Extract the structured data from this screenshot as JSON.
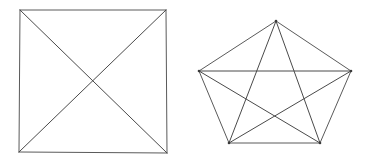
{
  "canvas": {
    "width": 371,
    "height": 159,
    "background_color": "#ffffff"
  },
  "style": {
    "line_color": "#5a5a5a",
    "line_color_dark": "#4a4a4a",
    "line_width": 1,
    "vertex_color": "#3a3a3a",
    "vertex_radius": 1.3
  },
  "figures": [
    {
      "id": "square-with-diagonals",
      "name": "Square with both diagonals",
      "shape": "square",
      "vertex_count": 4,
      "edge_count": 6,
      "vertices": [
        {
          "label": "A",
          "position": "top-left",
          "x": 20,
          "y": 10
        },
        {
          "label": "B",
          "position": "top-right",
          "x": 166,
          "y": 10
        },
        {
          "label": "C",
          "position": "bottom-right",
          "x": 167,
          "y": 153
        },
        {
          "label": "D",
          "position": "bottom-left",
          "x": 19,
          "y": 152
        }
      ],
      "edges": [
        {
          "from": 0,
          "to": 1,
          "kind": "side"
        },
        {
          "from": 1,
          "to": 2,
          "kind": "side"
        },
        {
          "from": 2,
          "to": 3,
          "kind": "side"
        },
        {
          "from": 3,
          "to": 0,
          "kind": "side"
        },
        {
          "from": 0,
          "to": 2,
          "kind": "diagonal"
        },
        {
          "from": 1,
          "to": 3,
          "kind": "diagonal"
        }
      ],
      "show_vertex_dots": false
    },
    {
      "id": "pentagon-with-diagonals",
      "name": "Regular pentagon with all diagonals forming a pentagram",
      "shape": "pentagon",
      "vertex_count": 5,
      "edge_count": 10,
      "vertices": [
        {
          "label": "P1",
          "position": "top",
          "x": 276,
          "y": 21
        },
        {
          "label": "P2",
          "position": "right",
          "x": 351,
          "y": 71
        },
        {
          "label": "P3",
          "position": "bottom-right",
          "x": 320,
          "y": 143
        },
        {
          "label": "P4",
          "position": "bottom-left",
          "x": 229,
          "y": 143
        },
        {
          "label": "P5",
          "position": "left",
          "x": 199,
          "y": 71
        }
      ],
      "edges": [
        {
          "from": 0,
          "to": 1,
          "kind": "side"
        },
        {
          "from": 1,
          "to": 2,
          "kind": "side"
        },
        {
          "from": 2,
          "to": 3,
          "kind": "side"
        },
        {
          "from": 3,
          "to": 4,
          "kind": "side"
        },
        {
          "from": 4,
          "to": 0,
          "kind": "side"
        },
        {
          "from": 0,
          "to": 2,
          "kind": "diagonal"
        },
        {
          "from": 0,
          "to": 3,
          "kind": "diagonal"
        },
        {
          "from": 1,
          "to": 3,
          "kind": "diagonal"
        },
        {
          "from": 1,
          "to": 4,
          "kind": "diagonal"
        },
        {
          "from": 2,
          "to": 4,
          "kind": "diagonal"
        }
      ],
      "show_vertex_dots": true
    }
  ]
}
